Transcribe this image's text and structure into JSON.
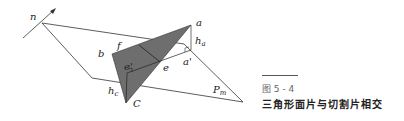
{
  "figure": {
    "labels": {
      "n": "n",
      "a": "a",
      "b": "b",
      "f": "f",
      "e_prime": "e'",
      "e": "e",
      "a_prime": "a'",
      "h_a": "h",
      "h_a_sub": "a",
      "h_c": "h",
      "h_c_sub": "c",
      "C": "C",
      "P": "P",
      "P_sub": "m"
    },
    "colors": {
      "triangle_fill": "#6e6e6e",
      "line": "#333333"
    }
  },
  "caption": {
    "number": "图 5 - 4",
    "title": "三角形面片与切割片相交"
  }
}
